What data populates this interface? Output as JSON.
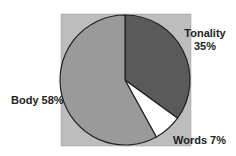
{
  "chart_data": {
    "type": "pie",
    "title": "",
    "slices": [
      {
        "label": "Tonality",
        "value": 35,
        "color": "#5a5a5a"
      },
      {
        "label": "Words",
        "value": 7,
        "color": "#ffffff"
      },
      {
        "label": "Body",
        "value": 58,
        "color": "#9a9a9a"
      }
    ],
    "start_angle_deg": 0,
    "direction": "clockwise",
    "plot_background": "#bdbdbd",
    "legend": "none",
    "labels": {
      "tonality": {
        "name": "Tonality",
        "pct": "35%"
      },
      "words": "Words 7%",
      "body": "Body 58%"
    }
  }
}
